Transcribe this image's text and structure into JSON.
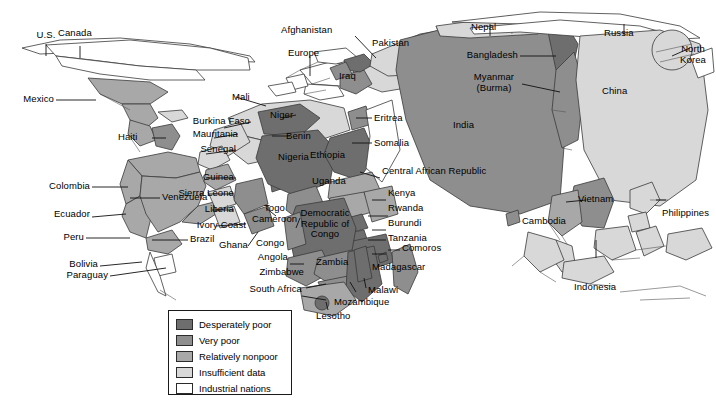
{
  "figure": {
    "type": "cartogram-map"
  },
  "legend": {
    "items": [
      {
        "label": "Desperately poor",
        "color": "#6e6e6e"
      },
      {
        "label": "Very poor",
        "color": "#8e8e8e"
      },
      {
        "label": "Relatively nonpoor",
        "color": "#a8a8a8"
      },
      {
        "label": "Insufficient data",
        "color": "#d8d8d8"
      },
      {
        "label": "Industrial nations",
        "color": "#ffffff"
      }
    ]
  },
  "colors": {
    "desperately_poor": "#6e6e6e",
    "very_poor": "#8e8e8e",
    "relatively_nonpoor": "#a8a8a8",
    "insufficient_data": "#d8d8d8",
    "industrial_nations": "#ffffff",
    "outline": "#3a3a3a",
    "leader_line": "#111111",
    "text": "#000000"
  },
  "labels": {
    "americas": [
      {
        "name": "us",
        "text": "U.S."
      },
      {
        "name": "canada",
        "text": "Canada"
      },
      {
        "name": "mexico",
        "text": "Mexico"
      },
      {
        "name": "haiti",
        "text": "Haiti"
      },
      {
        "name": "colombia",
        "text": "Colombia"
      },
      {
        "name": "ecuador",
        "text": "Ecuador"
      },
      {
        "name": "venezuela",
        "text": "Venezuela"
      },
      {
        "name": "peru",
        "text": "Peru"
      },
      {
        "name": "bolivia",
        "text": "Bolivia"
      },
      {
        "name": "brazil",
        "text": "Brazil"
      },
      {
        "name": "paraguay",
        "text": "Paraguay"
      }
    ],
    "west_africa": [
      {
        "name": "mali",
        "text": "Mali"
      },
      {
        "name": "burkina-faso",
        "text": "Burkina Faso"
      },
      {
        "name": "mauritania",
        "text": "Mauritania"
      },
      {
        "name": "senegal",
        "text": "Senegal"
      },
      {
        "name": "guinea",
        "text": "Guinea"
      },
      {
        "name": "sierra-leone",
        "text": "Sierra Leone"
      },
      {
        "name": "liberia",
        "text": "Liberia"
      },
      {
        "name": "ivory-coast",
        "text": "Ivory Coast"
      },
      {
        "name": "ghana",
        "text": "Ghana"
      },
      {
        "name": "togo",
        "text": "Togo"
      },
      {
        "name": "cameroon",
        "text": "Cameroon"
      },
      {
        "name": "niger",
        "text": "Niger"
      },
      {
        "name": "benin",
        "text": "Benin"
      },
      {
        "name": "nigeria",
        "text": "Nigeria"
      }
    ],
    "central_east_africa": [
      {
        "name": "eritrea",
        "text": "Eritrea"
      },
      {
        "name": "somalia",
        "text": "Somalia"
      },
      {
        "name": "ethiopia",
        "text": "Ethiopia"
      },
      {
        "name": "central-african-republic",
        "text": "Central African Republic"
      },
      {
        "name": "uganda",
        "text": "Uganda"
      },
      {
        "name": "kenya",
        "text": "Kenya"
      },
      {
        "name": "rwanda",
        "text": "Rwanda"
      },
      {
        "name": "burundi",
        "text": "Burundi"
      },
      {
        "name": "tanzania",
        "text": "Tanzania"
      },
      {
        "name": "comoros",
        "text": "Comoros"
      },
      {
        "name": "congo",
        "text": "Congo"
      },
      {
        "name": "democratic-republic-of-congo",
        "text": "Democratic Republic of Congo"
      }
    ],
    "southern_africa": [
      {
        "name": "angola",
        "text": "Angola"
      },
      {
        "name": "zambia",
        "text": "Zambia"
      },
      {
        "name": "zimbabwe",
        "text": "Zimbabwe"
      },
      {
        "name": "south-africa",
        "text": "South Africa"
      },
      {
        "name": "lesotho",
        "text": "Lesotho"
      },
      {
        "name": "mozambique",
        "text": "Mozambique"
      },
      {
        "name": "malawi",
        "text": "Malawi"
      },
      {
        "name": "madagascar",
        "text": "Madagascar"
      }
    ],
    "asia": [
      {
        "name": "afghanistan",
        "text": "Afghanistan"
      },
      {
        "name": "europe",
        "text": "Europe"
      },
      {
        "name": "iraq",
        "text": "Iraq"
      },
      {
        "name": "pakistan",
        "text": "Pakistan"
      },
      {
        "name": "nepal",
        "text": "Nepal"
      },
      {
        "name": "bangladesh",
        "text": "Bangladesh"
      },
      {
        "name": "myanmar",
        "text": "Myanmar (Burma)"
      },
      {
        "name": "india",
        "text": "India"
      },
      {
        "name": "russia",
        "text": "Russia"
      },
      {
        "name": "china",
        "text": "China"
      },
      {
        "name": "north-korea",
        "text": "North Korea"
      },
      {
        "name": "vietnam",
        "text": "Vietnam"
      },
      {
        "name": "cambodia",
        "text": "Cambodia"
      },
      {
        "name": "philippines",
        "text": "Philippines"
      },
      {
        "name": "indonesia",
        "text": "Indonesia"
      }
    ]
  }
}
